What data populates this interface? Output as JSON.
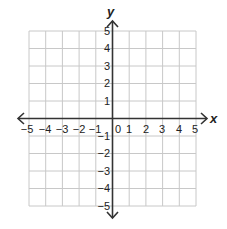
{
  "diagram": {
    "type": "coordinate-plane",
    "x_axis": {
      "label": "x",
      "min": -5,
      "max": 5
    },
    "y_axis": {
      "label": "y",
      "min": -5,
      "max": 5
    },
    "x_ticks": [
      "−5",
      "−4",
      "−3",
      "−2",
      "−1",
      "0",
      "1",
      "2",
      "3",
      "4",
      "5"
    ],
    "y_ticks": [
      "5",
      "4",
      "3",
      "2",
      "1",
      "−1",
      "−2",
      "−3",
      "−4",
      "−5"
    ],
    "colors": {
      "grid": "#c8c8c8",
      "axis": "#333333",
      "text": "#222222"
    }
  }
}
